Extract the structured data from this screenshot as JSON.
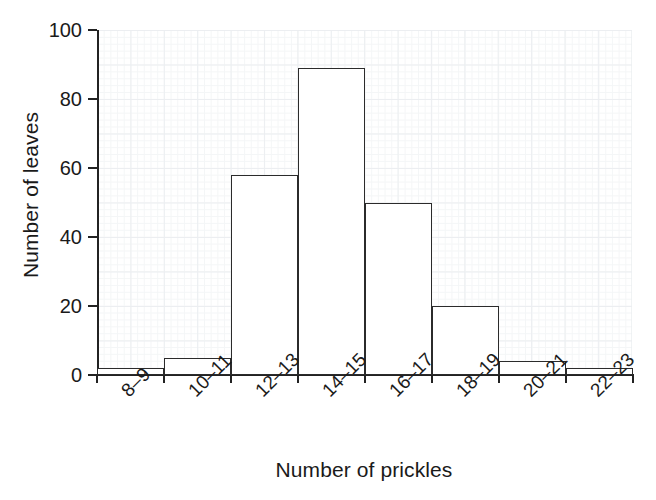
{
  "chart_data": {
    "type": "bar",
    "title": "",
    "subtitle": "",
    "xlabel": "Number of prickles",
    "ylabel": "Number of leaves",
    "categories": [
      "8–9",
      "10–11",
      "12–13",
      "14–15",
      "16–17",
      "18–19",
      "20–21",
      "22–23"
    ],
    "values": [
      2,
      5,
      58,
      89,
      50,
      20,
      4,
      2
    ],
    "ylim": [
      0,
      100
    ],
    "yticks": [
      0,
      20,
      40,
      60,
      80,
      100
    ],
    "ytick_labels": [
      "0",
      "20",
      "40",
      "60",
      "80",
      "100"
    ],
    "grid": true,
    "grid_style": "fine graph-paper grid, light gray",
    "legend": false,
    "legend_position": "none",
    "bar_style": {
      "fill": "#ffffff",
      "edge": "#2b2b2b",
      "gap": 0
    },
    "xtick_label_rotation": -45,
    "annotations": []
  },
  "colors": {
    "background": "#ffffff",
    "text": "#1a1a1a",
    "axis": "#222222",
    "grid_major": "#e9ecef",
    "grid_minor": "#f3f5f6",
    "bar_edge": "#2b2b2b",
    "bar_fill": "#ffffff"
  }
}
